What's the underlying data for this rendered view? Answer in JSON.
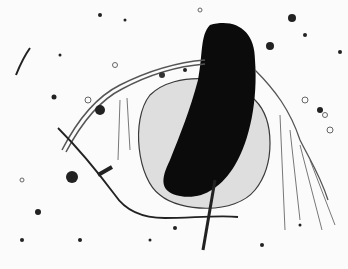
{
  "image": {
    "subject": "zooplankton (cladoceran) micrograph",
    "description": "Monochrome brightfield micrograph of a water flea with dark gut mass, transparent carapace, branched antennae, and scattered debris particles",
    "colors": {
      "background": "#fbfbfb",
      "body_dark": "#0a0a0a",
      "carapace": "#d9d9d9",
      "outline": "#3a3a3a"
    }
  }
}
